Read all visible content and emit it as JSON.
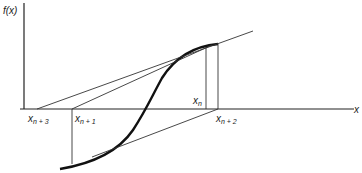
{
  "figure": {
    "y_axis_label": "f(x)",
    "x_axis_label": "x",
    "points": [
      {
        "id": "x_n+3",
        "base": "x",
        "subscript": "n + 3"
      },
      {
        "id": "x_n+1",
        "base": "x",
        "subscript": "n + 1"
      },
      {
        "id": "x_n",
        "base": "x",
        "subscript": "n"
      },
      {
        "id": "x_n+2",
        "base": "x",
        "subscript": "n + 2"
      }
    ],
    "colors": {
      "curve": "#111111",
      "lines": "#333333",
      "axes": "#222222",
      "background": "#ffffff"
    }
  }
}
